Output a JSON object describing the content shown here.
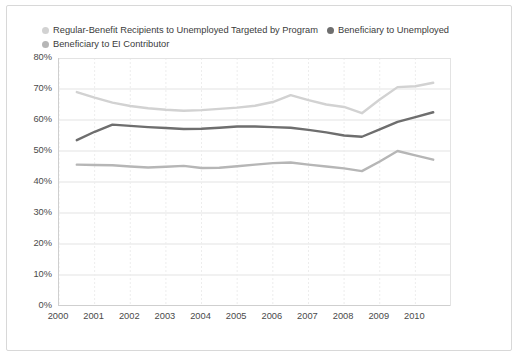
{
  "legend": {
    "items": [
      {
        "label": "Regular-Benefit Recipients to Unemployed Targeted by Program",
        "color": "#d2d2d2",
        "marker": "filled-circle-icon"
      },
      {
        "label": "Beneficiary to Unemployed",
        "color": "#6e6e6e",
        "marker": "filled-circle-icon"
      },
      {
        "label": "Beneficiary to EI Contributor",
        "color": "#b6b6b6",
        "marker": "filled-circle-icon"
      }
    ]
  },
  "chart_data": {
    "type": "line",
    "title": "",
    "subtitle": "",
    "xlabel": "",
    "ylabel": "",
    "xlim": [
      2000.0,
      2011.0
    ],
    "ylim": [
      0,
      80
    ],
    "grid": true,
    "grid_axes": "both",
    "legend_position": "top-left",
    "y_ticks": [
      0,
      10,
      20,
      30,
      40,
      50,
      60,
      70,
      80
    ],
    "y_tick_labels": [
      "0%",
      "10%",
      "20%",
      "30%",
      "40%",
      "50%",
      "60%",
      "70%",
      "80%"
    ],
    "x_ticks": [
      2000,
      2001,
      2002,
      2003,
      2004,
      2005,
      2006,
      2007,
      2008,
      2009,
      2010
    ],
    "x_tick_labels": [
      "2000",
      "2001",
      "2002",
      "2003",
      "2004",
      "2005",
      "2006",
      "2007",
      "2008",
      "2009",
      "2010"
    ],
    "x": [
      2000.5,
      2001.0,
      2001.5,
      2002.0,
      2002.5,
      2003.0,
      2003.5,
      2004.0,
      2004.5,
      2005.0,
      2005.5,
      2006.0,
      2006.5,
      2007.0,
      2007.5,
      2008.0,
      2008.5,
      2009.0,
      2009.5,
      2010.0,
      2010.5
    ],
    "series": [
      {
        "name": "Regular-Benefit Recipients to Unemployed Targeted by Program",
        "color": "#d2d2d2",
        "width": 2.4,
        "values": [
          69.0,
          67.2,
          65.6,
          64.5,
          63.8,
          63.3,
          63.0,
          63.2,
          63.6,
          64.0,
          64.6,
          65.8,
          68.0,
          66.4,
          65.0,
          64.2,
          62.2,
          66.6,
          70.6,
          70.9,
          72.0
        ]
      },
      {
        "name": "Beneficiary to Unemployed",
        "color": "#6e6e6e",
        "width": 2.4,
        "values": [
          53.5,
          56.2,
          58.5,
          58.1,
          57.7,
          57.4,
          57.1,
          57.2,
          57.5,
          57.9,
          57.9,
          57.7,
          57.5,
          56.8,
          56.0,
          55.0,
          54.6,
          57.0,
          59.4,
          60.9,
          62.5
        ]
      },
      {
        "name": "Beneficiary to EI Contributor",
        "color": "#b6b6b6",
        "width": 2.4,
        "values": [
          45.6,
          45.5,
          45.4,
          45.0,
          44.7,
          44.9,
          45.2,
          44.5,
          44.6,
          45.1,
          45.6,
          46.1,
          46.3,
          45.6,
          45.0,
          44.4,
          43.5,
          46.6,
          50.0,
          48.6,
          47.2
        ]
      }
    ]
  }
}
